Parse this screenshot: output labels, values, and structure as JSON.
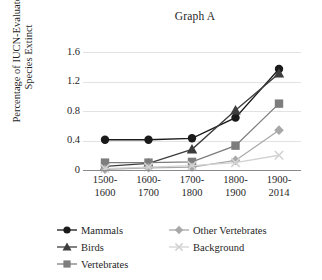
{
  "chart_data": {
    "type": "line",
    "title": "Graph A",
    "xlabel": "",
    "ylabel": "Percentage of IUCN-Evaluated Species Extinct",
    "categories": [
      "1500-1600",
      "1600-1700",
      "1700-1800",
      "1800-1900",
      "1900-2014"
    ],
    "ylim": [
      0,
      1.6
    ],
    "yticks": [
      0,
      0.4,
      0.8,
      1.2,
      1.6
    ],
    "ytick_labels": [
      "0",
      "0.4",
      "0.8",
      "1.2",
      "1.6"
    ],
    "grid": "horizontal",
    "legend_position": "bottom",
    "series": [
      {
        "name": "Mammals",
        "marker": "circle",
        "color": "#1a1a1a",
        "values": [
          0.41,
          0.41,
          0.43,
          0.71,
          1.37
        ]
      },
      {
        "name": "Birds",
        "marker": "triangle",
        "color": "#3d3d3d",
        "values": [
          0.05,
          0.09,
          0.28,
          0.81,
          1.31
        ]
      },
      {
        "name": "Vertebrates",
        "marker": "square",
        "color": "#7d7d7d",
        "values": [
          0.1,
          0.1,
          0.11,
          0.33,
          0.9
        ]
      },
      {
        "name": "Other Vertebrates",
        "marker": "diamond",
        "color": "#a8a8a8",
        "values": [
          0.01,
          0.03,
          0.04,
          0.13,
          0.54
        ]
      },
      {
        "name": "Background",
        "marker": "cross",
        "color": "#d2d2d2",
        "values": [
          0.02,
          0.04,
          0.06,
          0.1,
          0.2
        ]
      }
    ]
  },
  "axis": {
    "ytick_0": "0",
    "ytick_1": "0.4",
    "ytick_2": "0.8",
    "ytick_3": "1.2",
    "ytick_4": "1.6",
    "ylabel_line1": "Percentage of IUCN-Evaluated",
    "ylabel_line2": "Species Extinct"
  },
  "xticks": [
    {
      "top": "1500-",
      "bottom": "1600"
    },
    {
      "top": "1600-",
      "bottom": "1700"
    },
    {
      "top": "1700-",
      "bottom": "1800"
    },
    {
      "top": "1800-",
      "bottom": "1900"
    },
    {
      "top": "1900-",
      "bottom": "2014"
    }
  ],
  "legend": {
    "items": [
      {
        "label": "Mammals",
        "marker": "circle",
        "color": "#1a1a1a"
      },
      {
        "label": "Birds",
        "marker": "triangle",
        "color": "#3d3d3d"
      },
      {
        "label": "Vertebrates",
        "marker": "square",
        "color": "#7d7d7d"
      },
      {
        "label": "Other Vertebrates",
        "marker": "diamond",
        "color": "#a8a8a8"
      },
      {
        "label": "Background",
        "marker": "cross",
        "color": "#d2d2d2"
      }
    ]
  }
}
